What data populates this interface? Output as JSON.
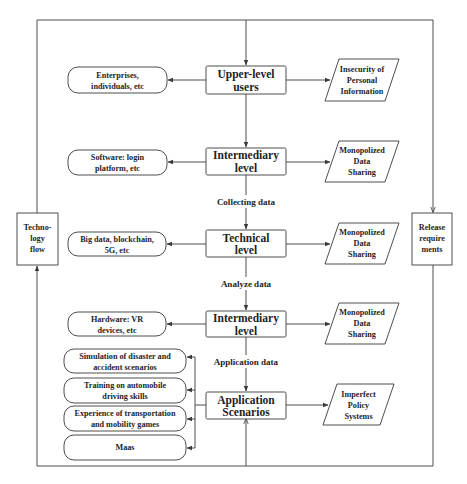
{
  "diagram": {
    "center_nodes": {
      "upper_users": [
        "Upper-level",
        "users"
      ],
      "intermediary_1": [
        "Intermediary",
        "level"
      ],
      "technical": [
        "Technical",
        "level"
      ],
      "intermediary_2": [
        "Intermediary",
        "level"
      ],
      "application": [
        "Application",
        "Scenarios"
      ]
    },
    "left_nodes": {
      "enterprises": [
        "Enterprises,",
        "individuals, etc"
      ],
      "software": [
        "Software: login",
        "platform, etc"
      ],
      "bigdata": [
        "Big data, blockchain,",
        "5G, etc"
      ],
      "hardware": [
        "Hardware: VR",
        "devices, etc"
      ]
    },
    "scenarios": [
      [
        "Simulation of disaster and",
        "accident scenarios"
      ],
      [
        "Training on automobile",
        "driving skills"
      ],
      [
        "Experience of transportation",
        "and mobility games"
      ],
      [
        "Maas"
      ]
    ],
    "right_nodes": {
      "insecurity": [
        "Insecurity of",
        "Personal",
        "Information"
      ],
      "monopolized_1": [
        "Monopolized",
        "Data",
        "Sharing"
      ],
      "monopolized_2": [
        "Monopolized",
        "Data",
        "Sharing"
      ],
      "monopolized_3": [
        "Monopolized",
        "Data",
        "Sharing"
      ],
      "imperfect": [
        "Imperfect",
        "Policy",
        "Systems"
      ]
    },
    "edge_labels": {
      "collecting": "Collecting data",
      "analyze": "Analyze data",
      "application": "Application data"
    },
    "side_boxes": {
      "technology_flow": [
        "Techno-",
        "logy",
        "flow"
      ],
      "release_requirements": [
        "Release",
        "require",
        "ments"
      ]
    },
    "colors": {
      "stroke": "#3a3a3a",
      "text": "#1e1e1e",
      "background": "#ffffff"
    }
  }
}
